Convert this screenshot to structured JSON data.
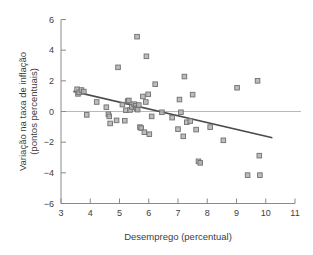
{
  "chart_data": {
    "type": "scatter",
    "title": "",
    "xlabel": "Desemprego (percentual)",
    "ylabel": "Variação na taxa de inflação (pontos percentuais)",
    "ylabel_line1": "Variação na taxa de inflação",
    "ylabel_line2": "(pontos percentuais)",
    "xlim": [
      3,
      11
    ],
    "ylim": [
      -6,
      6
    ],
    "xticks": [
      3,
      4,
      5,
      6,
      7,
      8,
      9,
      10,
      11
    ],
    "xtick_labels": [
      "3",
      "4",
      "5",
      "6",
      "7",
      "8",
      "9",
      "10",
      "11"
    ],
    "yticks": [
      -6,
      -4,
      -2,
      0,
      2,
      4,
      6
    ],
    "ytick_labels": [
      "−6",
      "−4",
      "−2",
      "0",
      "2",
      "4",
      "6"
    ],
    "grid": false,
    "zero_line": true,
    "legend": "none",
    "marker_shape": "square",
    "marker_color": "#b2b2b2",
    "marker_edge_color": "#6f6f6f",
    "fit_line_color": "#4a4a4a",
    "axis_color": "#8a8a8a",
    "zero_line_color": "#b9b9b9",
    "points": [
      [
        3.55,
        1.45
      ],
      [
        3.58,
        1.15
      ],
      [
        3.62,
        1.25
      ],
      [
        3.7,
        1.4
      ],
      [
        3.78,
        1.3
      ],
      [
        3.88,
        -0.22
      ],
      [
        4.22,
        0.62
      ],
      [
        4.55,
        0.28
      ],
      [
        4.62,
        -0.18
      ],
      [
        4.65,
        -0.32
      ],
      [
        4.68,
        -0.78
      ],
      [
        4.9,
        -0.58
      ],
      [
        4.95,
        2.88
      ],
      [
        5.1,
        0.45
      ],
      [
        5.18,
        -0.6
      ],
      [
        5.22,
        0.08
      ],
      [
        5.28,
        0.68
      ],
      [
        5.32,
        0.72
      ],
      [
        5.36,
        0.1
      ],
      [
        5.42,
        0.3
      ],
      [
        5.5,
        0.48
      ],
      [
        5.55,
        0.38
      ],
      [
        5.58,
        0.2
      ],
      [
        5.6,
        4.88
      ],
      [
        5.62,
        0.12
      ],
      [
        5.66,
        0.42
      ],
      [
        5.7,
        -1.02
      ],
      [
        5.74,
        -1.08
      ],
      [
        5.8,
        0.98
      ],
      [
        5.85,
        -1.35
      ],
      [
        5.9,
        0.62
      ],
      [
        5.92,
        3.6
      ],
      [
        5.98,
        1.12
      ],
      [
        6.02,
        -1.48
      ],
      [
        6.1,
        -0.32
      ],
      [
        6.22,
        1.78
      ],
      [
        6.45,
        -0.05
      ],
      [
        6.8,
        -0.4
      ],
      [
        7.0,
        -1.15
      ],
      [
        7.05,
        0.78
      ],
      [
        7.1,
        -0.05
      ],
      [
        7.18,
        -1.62
      ],
      [
        7.22,
        2.28
      ],
      [
        7.3,
        -0.7
      ],
      [
        7.42,
        -0.62
      ],
      [
        7.5,
        1.1
      ],
      [
        7.62,
        -1.18
      ],
      [
        7.7,
        -3.25
      ],
      [
        7.76,
        -3.35
      ],
      [
        8.1,
        -1.02
      ],
      [
        8.55,
        -1.88
      ],
      [
        9.02,
        1.55
      ],
      [
        9.38,
        -4.15
      ],
      [
        9.72,
        2.0
      ],
      [
        9.78,
        -2.88
      ],
      [
        9.8,
        -4.15
      ]
    ],
    "fit_line": {
      "x_start": 3.45,
      "y_start": 1.3,
      "x_end": 10.2,
      "y_end": -1.7
    }
  }
}
